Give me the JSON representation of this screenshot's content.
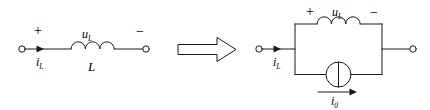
{
  "figure": {
    "type": "circuit-diagram",
    "background_color": "#ffffff",
    "stroke_color": "#1a1a1a"
  },
  "left_circuit": {
    "name": "inductor-branch",
    "plus_sign": "+",
    "minus_sign": "−",
    "voltage_label": "u",
    "voltage_subscript": "L",
    "current_label": "i",
    "current_subscript": "L",
    "element_label": "L",
    "terminals": [
      "left-terminal",
      "right-terminal"
    ],
    "components": [
      "inductor-coil",
      "current-arrow"
    ]
  },
  "transform_arrow": {
    "name": "equivalence-arrow",
    "glyph": "⇒",
    "direction": "right"
  },
  "right_circuit": {
    "name": "equivalent-parallel-model",
    "plus_sign": "+",
    "minus_sign": "−",
    "voltage_label": "u",
    "voltage_subscript": "L",
    "current_label": "i",
    "current_subscript": "L",
    "source_current_label": "i",
    "source_current_subscript": "0",
    "terminals": [
      "left-terminal",
      "right-terminal"
    ],
    "components": [
      "inductor-coil",
      "current-source",
      "source-arrow"
    ]
  }
}
